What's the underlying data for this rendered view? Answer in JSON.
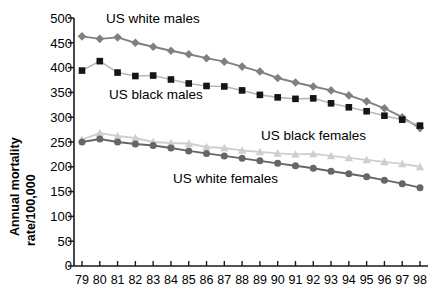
{
  "chart_data": {
    "type": "line",
    "title": "",
    "xlabel": "",
    "ylabel": "Annual mortality rate/100,000",
    "ylabel_line1": "Annual mortality",
    "ylabel_line2": "rate/100,000",
    "ylim": [
      0,
      500
    ],
    "ytick_step": 50,
    "yticks": [
      "500",
      "450",
      "400",
      "350",
      "300",
      "250",
      "200",
      "150",
      "100",
      "50",
      "0"
    ],
    "grid": false,
    "legend_position": "inline-annotations",
    "categories": [
      "79",
      "80",
      "81",
      "82",
      "83",
      "84",
      "85",
      "86",
      "87",
      "88",
      "89",
      "90",
      "91",
      "92",
      "93",
      "94",
      "95",
      "96",
      "97",
      "98"
    ],
    "series": [
      {
        "name": "US white males",
        "label": "US white males",
        "marker": "diamond",
        "color": "#808080",
        "values": [
          463,
          458,
          461,
          450,
          442,
          434,
          427,
          419,
          412,
          402,
          392,
          379,
          370,
          362,
          354,
          344,
          332,
          318,
          300,
          278
        ]
      },
      {
        "name": "US black males",
        "label": "US black males",
        "marker": "square",
        "color": "#151515",
        "line_color": "#b8b8b8",
        "values": [
          394,
          413,
          390,
          383,
          384,
          376,
          368,
          363,
          362,
          354,
          345,
          340,
          337,
          338,
          328,
          320,
          312,
          303,
          295,
          283
        ]
      },
      {
        "name": "US black females",
        "label": "US black females",
        "marker": "triangle",
        "color": "#cfcfcf",
        "values": [
          255,
          268,
          262,
          258,
          250,
          248,
          247,
          240,
          238,
          233,
          230,
          227,
          225,
          226,
          222,
          218,
          214,
          210,
          206,
          200
        ]
      },
      {
        "name": "US white females",
        "label": "US white females",
        "marker": "circle",
        "color": "#666666",
        "values": [
          250,
          256,
          250,
          246,
          243,
          238,
          232,
          227,
          222,
          217,
          212,
          207,
          202,
          197,
          191,
          186,
          180,
          173,
          166,
          158
        ]
      }
    ],
    "annotations": [
      {
        "text": "US white males",
        "x_pct": 0.07,
        "y_value": 497
      },
      {
        "text": "US black males",
        "x_pct": 0.08,
        "y_value": 345
      },
      {
        "text": "US black females",
        "x_pct": 0.53,
        "y_value": 262
      },
      {
        "text": "US white females",
        "x_pct": 0.27,
        "y_value": 176
      }
    ],
    "colors": {
      "axis": "#1a1a1a",
      "white_males": "#808080",
      "black_males": "#151515",
      "black_females": "#cfcfcf",
      "white_females": "#666666",
      "background": "#ffffff"
    }
  }
}
